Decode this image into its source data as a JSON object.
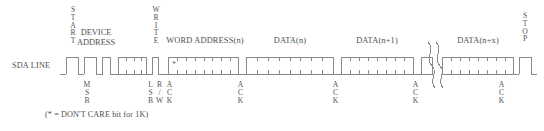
{
  "diagram": {
    "signal_label": "SDA LINE",
    "footnote": "(* = DON'T CARE bit for 1K)",
    "dont_care_marker": "*",
    "line_color": "#808080",
    "text_color": "#4f4f4f",
    "background": "#ffffff"
  },
  "top_labels": [
    {
      "name": "start",
      "text": "START",
      "orientation": "vertical",
      "x": 72,
      "y": 4
    },
    {
      "name": "device-address",
      "line1": "DEVICE",
      "line2": "ADDRESS",
      "orientation": "horizontal",
      "x": 95,
      "y": 28
    },
    {
      "name": "write",
      "text": "WRITE",
      "orientation": "vertical",
      "x": 156,
      "y": 4
    },
    {
      "name": "word-address",
      "text": "WORD ADDRESS(n)",
      "orientation": "horizontal",
      "x": 173,
      "y": 36
    },
    {
      "name": "data-n",
      "text": "DATA(n)",
      "orientation": "horizontal",
      "x": 276,
      "y": 36
    },
    {
      "name": "data-n-plus-1",
      "text": "DATA(n+1)",
      "orientation": "horizontal",
      "x": 355,
      "y": 36
    },
    {
      "name": "data-n-plus-x",
      "text": "DATA(n+x)",
      "orientation": "horizontal",
      "x": 455,
      "y": 36
    },
    {
      "name": "stop",
      "text": "STOP",
      "orientation": "vertical",
      "x": 521,
      "y": 4
    }
  ],
  "bottom_labels": [
    {
      "name": "msb",
      "text": "MSB",
      "x": 81,
      "y": 82
    },
    {
      "name": "lsb",
      "text": "LSB",
      "x": 146,
      "y": 82
    },
    {
      "name": "read-write",
      "text": "R/W",
      "x": 155,
      "y": 82
    },
    {
      "name": "ack-0",
      "text": "ACK",
      "x": 166,
      "y": 82
    },
    {
      "name": "ack-1",
      "text": "ACK",
      "x": 236,
      "y": 82
    },
    {
      "name": "ack-2",
      "text": "ACK",
      "x": 331,
      "y": 82
    },
    {
      "name": "ack-3",
      "text": "ACK",
      "x": 411,
      "y": 82
    },
    {
      "name": "ack-4",
      "text": "ACK",
      "x": 497,
      "y": 82
    }
  ],
  "waveform": {
    "baseline_y": 74,
    "high_y": 57,
    "description": "SDA serial data line with START condition, device address byte, write bit, acknowledge, word address byte, data bytes and STOP condition",
    "break_symbol": "squiggle"
  }
}
